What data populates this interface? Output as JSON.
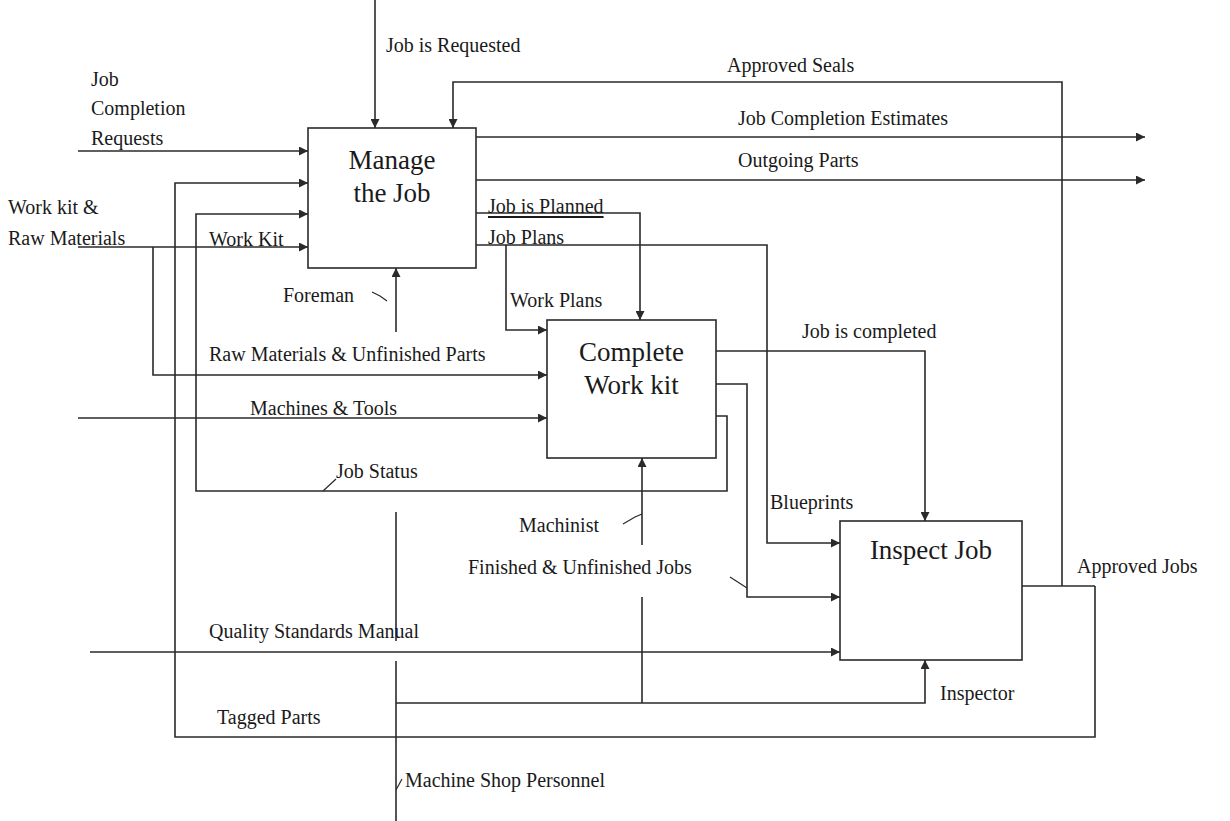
{
  "colors": {
    "line": "#2a2a2a",
    "text": "#1a1a1a",
    "background": "#ffffff"
  },
  "activities": [
    {
      "id": "A1",
      "title_line1": "Manage",
      "title_line2": "the Job"
    },
    {
      "id": "A2",
      "title_line1": "Complete",
      "title_line2": "Work kit"
    },
    {
      "id": "A3",
      "title_line1": "Inspect Job",
      "title_line2": ""
    }
  ],
  "labels": {
    "job_is_requested": "Job is Requested",
    "job_completion_requests_1": "Job",
    "job_completion_requests_2": "Completion",
    "job_completion_requests_3": "Requests",
    "work_kit_raw_materials_1": "Work kit &",
    "work_kit_raw_materials_2": "Raw Materials",
    "work_kit": "Work Kit",
    "approved_seals": "Approved Seals",
    "job_completion_estimates": "Job Completion Estimates",
    "outgoing_parts": "Outgoing Parts",
    "job_is_planned": "Job is Planned",
    "job_plans": "Job Plans",
    "work_plans": "Work Plans",
    "foreman": "Foreman",
    "raw_materials_unfinished_parts": "Raw Materials & Unfinished Parts",
    "machines_tools": "Machines & Tools",
    "job_status": "Job Status",
    "job_is_completed": "Job is completed",
    "blueprints": "Blueprints",
    "machinist": "Machinist",
    "finished_unfinished_jobs": "Finished & Unfinished Jobs",
    "approved_jobs": "Approved Jobs",
    "quality_standards_manual": "Quality Standards Manual",
    "inspector": "Inspector",
    "tagged_parts": "Tagged Parts",
    "machine_shop_personnel": "Machine Shop Personnel"
  }
}
